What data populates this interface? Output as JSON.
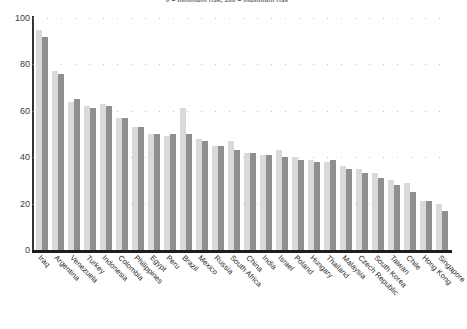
{
  "chart_data": {
    "type": "bar",
    "title": "0 = minimum risk, 100 = maximum risk",
    "subtitle": "",
    "xlabel": "",
    "ylabel": "",
    "ylim": [
      0,
      100
    ],
    "yticks": [
      0,
      20,
      40,
      60,
      80,
      100
    ],
    "grid": true,
    "grid_style": "dotted-horizontal",
    "legend": "none",
    "orientation": "vertical",
    "categories": [
      "Iraq",
      "Argentina",
      "Venezuela",
      "Turkey",
      "Indonesia",
      "Colombia",
      "Philippines",
      "Egypt",
      "Peru",
      "Brazil",
      "Mexico",
      "Russia",
      "South Africa",
      "China",
      "India",
      "Israel",
      "Poland",
      "Hungary",
      "Thailand",
      "Malaysia",
      "Czech Republic",
      "South Korea",
      "Taiwan",
      "Chile",
      "Hong Kong",
      "Singapore"
    ],
    "series": [
      {
        "name": "series-light",
        "color": "#d9d9d9",
        "values": [
          95,
          77,
          64,
          62,
          63,
          57,
          53,
          50,
          49,
          61,
          48,
          45,
          47,
          42,
          41,
          43,
          40,
          39,
          38,
          36,
          35,
          33,
          30,
          29,
          21,
          20
        ]
      },
      {
        "name": "series-dark",
        "color": "#8f8f8f",
        "values": [
          92,
          76,
          65,
          61,
          62,
          57,
          53,
          50,
          50,
          50,
          47,
          45,
          43,
          42,
          41,
          40,
          39,
          38,
          39,
          35,
          33,
          31,
          28,
          25,
          21,
          17
        ]
      }
    ]
  },
  "footer": {
    "source": ""
  },
  "axis": {
    "y_tick_labels": [
      "100",
      "80",
      "60",
      "40",
      "20",
      "0"
    ]
  }
}
